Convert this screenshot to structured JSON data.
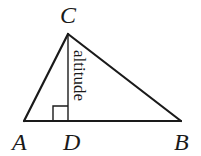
{
  "diagram": {
    "type": "geometry-triangle",
    "vertices": {
      "A": {
        "label": "A",
        "x": 24,
        "y": 121
      },
      "B": {
        "label": "B",
        "x": 181,
        "y": 121
      },
      "C": {
        "label": "C",
        "x": 68,
        "y": 34
      },
      "D": {
        "label": "D",
        "x": 68,
        "y": 121
      }
    },
    "segments": [
      {
        "from": "A",
        "to": "C"
      },
      {
        "from": "C",
        "to": "B"
      },
      {
        "from": "A",
        "to": "B"
      },
      {
        "from": "C",
        "to": "D",
        "role": "altitude"
      }
    ],
    "altitude_label": "altitude",
    "right_angle_marker": {
      "at": "D",
      "size": 15
    },
    "colors": {
      "stroke": "#1a1a1a",
      "background": "#ffffff"
    }
  }
}
